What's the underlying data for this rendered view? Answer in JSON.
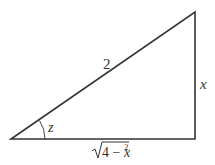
{
  "diagram": {
    "type": "right-triangle",
    "vertices": {
      "bottom_left": [
        11,
        139
      ],
      "bottom_right": [
        195,
        139
      ],
      "top_right": [
        195,
        12
      ]
    },
    "labels": {
      "hypotenuse": "2",
      "vertical_side": "x",
      "angle": "z",
      "base_radical": "4 − x",
      "base_exponent": "2"
    },
    "colors": {
      "stroke": "#333333",
      "background": "#ffffff"
    }
  }
}
